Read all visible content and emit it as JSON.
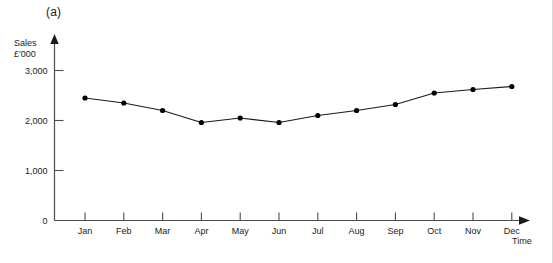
{
  "figure": {
    "panel_label": "(a)",
    "background_color": "#ffffff",
    "line_color": "#1a1a1a",
    "marker_color": "#000000",
    "axis_color": "#4d4d4d"
  },
  "chart_data": {
    "type": "line",
    "title": "",
    "subtitle": "",
    "xlabel": "Time",
    "ylabel": "Sales\n£'000",
    "ylabel_lines": [
      "Sales",
      "£'000"
    ],
    "categories": [
      "Jan",
      "Feb",
      "Mar",
      "Apr",
      "May",
      "Jun",
      "Jul",
      "Aug",
      "Sep",
      "Oct",
      "Nov",
      "Dec"
    ],
    "values": [
      2450,
      2350,
      2200,
      1960,
      2050,
      1960,
      2100,
      2200,
      2320,
      2550,
      2620,
      2680
    ],
    "series": [
      {
        "name": "Sales",
        "values": [
          2450,
          2350,
          2200,
          1960,
          2050,
          1960,
          2100,
          2200,
          2320,
          2550,
          2620,
          2680
        ]
      }
    ],
    "ylim": [
      0,
      3200
    ],
    "yticks": [
      0,
      1000,
      2000,
      3000
    ],
    "ytick_labels": [
      "0",
      "1,000",
      "2,000",
      "3,000"
    ],
    "xtick_labels": [
      "Jan",
      "Feb",
      "Mar",
      "Apr",
      "May",
      "Jun",
      "Jul",
      "Aug",
      "Sep",
      "Oct",
      "Nov",
      "Dec"
    ],
    "grid": false,
    "legend": false,
    "legend_position": "none",
    "markers": "filled-circle",
    "axis_arrows": true
  }
}
